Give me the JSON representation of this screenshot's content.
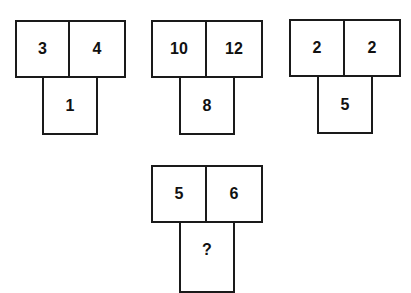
{
  "puzzle": {
    "groups": [
      {
        "left": "3",
        "right": "4",
        "bottom": "1"
      },
      {
        "left": "10",
        "right": "12",
        "bottom": "8"
      },
      {
        "left": "2",
        "right": "2",
        "bottom": "5"
      },
      {
        "left": "5",
        "right": "6",
        "bottom": "?"
      }
    ]
  },
  "colors": {
    "line": "#1a1a1a",
    "text": "#111111",
    "background": "#ffffff"
  }
}
